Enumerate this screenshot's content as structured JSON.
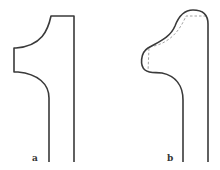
{
  "figure": {
    "panels": [
      {
        "id": "a",
        "label": "a",
        "description": "Angular profile with straight top and rectangular notch"
      },
      {
        "id": "b",
        "label": "b",
        "description": "Rounded profile with dashed original outline"
      }
    ],
    "colors": {
      "outline": "#3a3a3a",
      "dashed": "#8a8a8a",
      "background": "#ffffff"
    }
  }
}
